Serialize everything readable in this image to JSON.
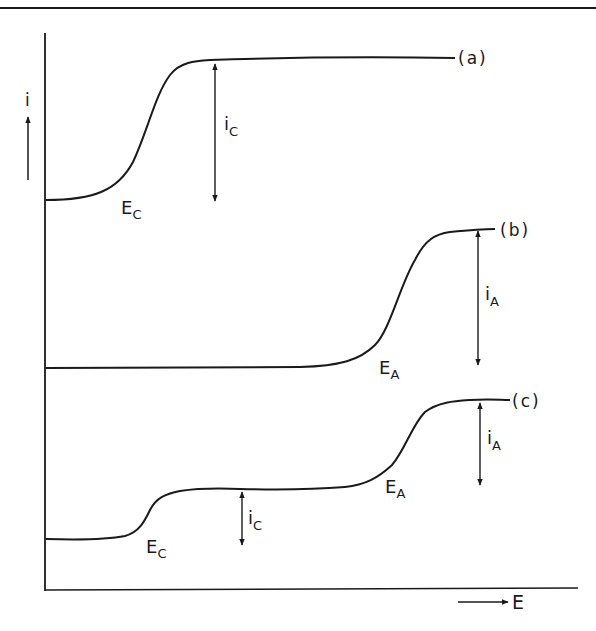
{
  "figure": {
    "type": "polarographic-waves-schematic",
    "axes": {
      "y_label": "i",
      "x_label": "E"
    },
    "curves": [
      {
        "id": "a",
        "label": "(a)",
        "waves": [
          {
            "potential_label": "E",
            "potential_sub": "C",
            "current_label": "i",
            "current_sub": "C"
          }
        ]
      },
      {
        "id": "b",
        "label": "(b)",
        "waves": [
          {
            "potential_label": "E",
            "potential_sub": "A",
            "current_label": "i",
            "current_sub": "A"
          }
        ]
      },
      {
        "id": "c",
        "label": "(c)",
        "waves": [
          {
            "potential_label": "E",
            "potential_sub": "C",
            "current_label": "i",
            "current_sub": "C"
          },
          {
            "potential_label": "E",
            "potential_sub": "A",
            "current_label": "i",
            "current_sub": "A"
          }
        ]
      }
    ],
    "colors": {
      "ink": "#1a1a1a",
      "background": "#ffffff"
    }
  }
}
